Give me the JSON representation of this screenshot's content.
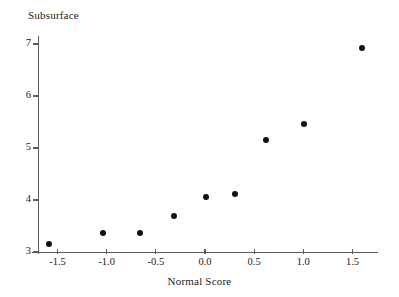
{
  "chart_data": {
    "type": "scatter",
    "title": "Subsurface",
    "xlabel": "Normal Score",
    "ylabel": "",
    "xlim": [
      -1.75,
      1.72
    ],
    "ylim": [
      3.0,
      7.15
    ],
    "grid": false,
    "legend": "none",
    "marker": "filled-circle",
    "marker_color": "#111111",
    "axis_color": "#5c5c5c",
    "x_ticks": [
      "-1.5",
      "-1.0",
      "-0.5",
      "0.0",
      "0.5",
      "1.0",
      "1.5"
    ],
    "x_tick_values": [
      -1.5,
      -1.0,
      -0.5,
      0.0,
      0.5,
      1.0,
      1.5
    ],
    "y_ticks": [
      "7",
      "6",
      "5",
      "4",
      "3"
    ],
    "y_tick_values": [
      7,
      6,
      5,
      4,
      3
    ],
    "x": [
      -1.59,
      -1.04,
      -0.66,
      -0.32,
      0.01,
      0.31,
      0.62,
      1.01,
      1.6
    ],
    "y": [
      3.15,
      3.37,
      3.37,
      3.69,
      4.06,
      4.12,
      5.15,
      5.46,
      6.92
    ],
    "points": [
      {
        "x": -1.59,
        "y": 3.15
      },
      {
        "x": -1.04,
        "y": 3.37
      },
      {
        "x": -0.66,
        "y": 3.37
      },
      {
        "x": -0.32,
        "y": 3.69
      },
      {
        "x": 0.01,
        "y": 4.06
      },
      {
        "x": 0.31,
        "y": 4.12
      },
      {
        "x": 0.62,
        "y": 5.15
      },
      {
        "x": 1.01,
        "y": 5.46
      },
      {
        "x": 1.6,
        "y": 6.92
      }
    ]
  }
}
